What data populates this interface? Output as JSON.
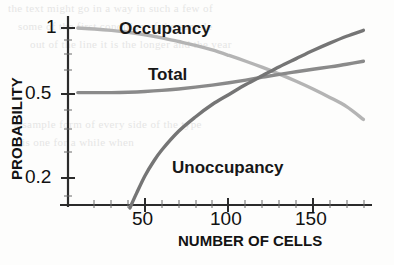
{
  "chart_data": {
    "type": "line",
    "title": "",
    "xlabel": "NUMBER OF CELLS",
    "ylabel": "PROBABILITY",
    "xlim": [
      10,
      185
    ],
    "ylim": [
      0.14,
      1.05
    ],
    "yscale": "log",
    "xscale": "linear",
    "grid": false,
    "legend": "inline-annotations",
    "xticks": [
      50,
      100,
      150
    ],
    "xtick_labels": [
      "50",
      "100",
      "150"
    ],
    "yticks": [
      1,
      0.5,
      0.2
    ],
    "ytick_labels": [
      "1",
      "0.5",
      "0.2"
    ],
    "crossing_point": {
      "x": 118,
      "y": 0.58
    },
    "series": [
      {
        "name": "Occupancy",
        "color": "#b4b4b4",
        "x": [
          10,
          20,
          30,
          40,
          50,
          60,
          70,
          80,
          90,
          100,
          110,
          120,
          130,
          140,
          150,
          160,
          170,
          180
        ],
        "values": [
          1.0,
          0.99,
          0.975,
          0.955,
          0.93,
          0.9,
          0.865,
          0.83,
          0.79,
          0.745,
          0.7,
          0.655,
          0.61,
          0.565,
          0.52,
          0.475,
          0.43,
          0.375
        ]
      },
      {
        "name": "Total",
        "color": "#8a8a8a",
        "x": [
          10,
          20,
          30,
          40,
          50,
          60,
          70,
          80,
          90,
          100,
          110,
          120,
          130,
          140,
          150,
          160,
          170,
          180
        ],
        "values": [
          0.5,
          0.5,
          0.5,
          0.502,
          0.506,
          0.512,
          0.52,
          0.53,
          0.542,
          0.556,
          0.572,
          0.59,
          0.608,
          0.625,
          0.642,
          0.659,
          0.678,
          0.7
        ]
      },
      {
        "name": "Unoccupancy",
        "color": "#757575",
        "x": [
          41,
          45,
          50,
          55,
          60,
          70,
          80,
          90,
          100,
          110,
          120,
          130,
          140,
          150,
          160,
          170,
          180
        ],
        "values": [
          0.145,
          0.17,
          0.205,
          0.238,
          0.27,
          0.33,
          0.385,
          0.44,
          0.49,
          0.545,
          0.6,
          0.66,
          0.72,
          0.785,
          0.85,
          0.915,
          0.975
        ]
      }
    ],
    "annotations": [
      {
        "name": "Occupancy",
        "text": "Occupancy",
        "x_px": 119,
        "y_px": 19
      },
      {
        "name": "Total",
        "text": "Total",
        "x_px": 148,
        "y_px": 65
      },
      {
        "name": "Unoccupancy",
        "text": "Unoccupancy",
        "x_px": 172,
        "y_px": 158
      }
    ]
  },
  "axes": {
    "y_title": "PROBABILITY",
    "x_title": "NUMBER OF CELLS",
    "y_tick_labels": [
      "1",
      "0.5",
      "0.2"
    ],
    "x_tick_labels": [
      "50",
      "100",
      "150"
    ]
  },
  "background_text": {
    "lines": [
      "the text might go in a way in such a few of",
      "some of the first condition of the sample",
      "out of the line it is the longer and the year",
      "a sample form of every side of the type",
      "is one for a while when"
    ]
  }
}
